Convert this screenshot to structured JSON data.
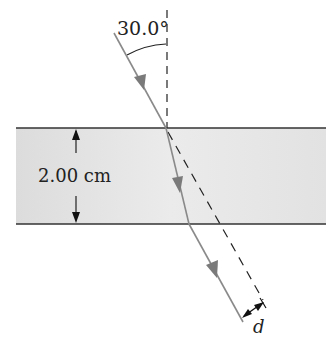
{
  "figure": {
    "incident_angle_label": "30.0°",
    "thickness_label": "2.00 cm",
    "displacement_label": "d"
  },
  "colors": {
    "slab_fill": "#e6e6e6",
    "slab_border": "#333333",
    "ray": "#8a8a8a",
    "arrowhead": "#7a7a7a",
    "dashed_normal": "#222222",
    "text": "#222222"
  },
  "geometry": {
    "slab_top_y": 128,
    "slab_bottom_y": 224,
    "slab_left_x": 16,
    "slab_right_x": 326,
    "entry_point": [
      166,
      128
    ],
    "exit_point": [
      189,
      224
    ],
    "incident_start": [
      114,
      33
    ],
    "emergent_end": [
      243,
      322
    ]
  }
}
